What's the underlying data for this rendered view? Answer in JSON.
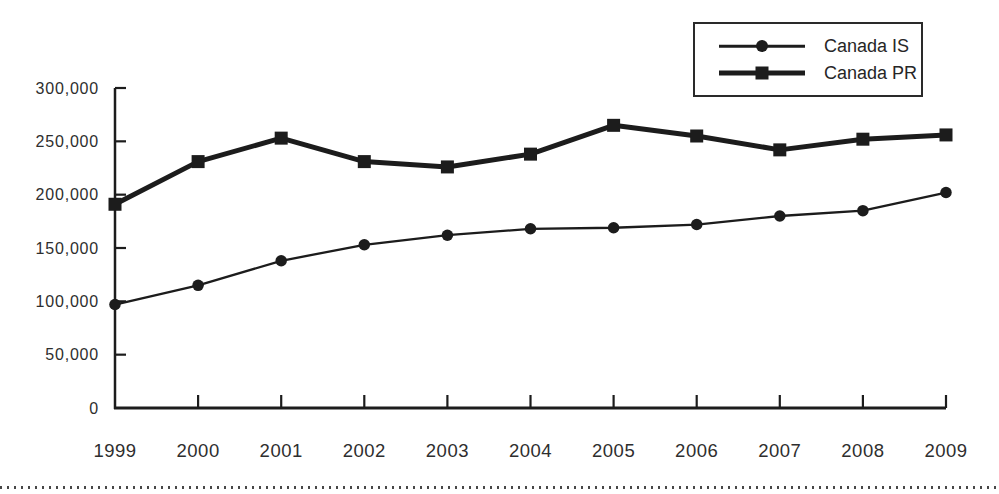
{
  "page": {
    "background": "#ffffff"
  },
  "colors": {
    "ink": "#1c1c1c",
    "text": "#2e2e2e",
    "rule_dots": "#474747"
  },
  "legend": {
    "items": [
      {
        "label": "Canada IS",
        "marker": "circle"
      },
      {
        "label": "Canada PR",
        "marker": "square"
      }
    ]
  },
  "chart_data": {
    "type": "line",
    "title": "",
    "xlabel": "",
    "ylabel": "",
    "categories": [
      "1999",
      "2000",
      "2001",
      "2002",
      "2003",
      "2004",
      "2005",
      "2006",
      "2007",
      "2008",
      "2009"
    ],
    "series": [
      {
        "name": "Canada IS",
        "marker": "circle",
        "marker_size": 11.5,
        "line_width": 2.3,
        "values": [
          97000,
          115000,
          138000,
          153000,
          162000,
          168000,
          169000,
          172000,
          180000,
          185000,
          202000
        ]
      },
      {
        "name": "Canada PR",
        "marker": "square",
        "marker_size": 13,
        "line_width": 5,
        "values": [
          191000,
          231000,
          253000,
          231000,
          226000,
          238000,
          265000,
          255000,
          242000,
          252000,
          256000
        ]
      }
    ],
    "ylim": [
      0,
      300000
    ],
    "y_ticks": [
      0,
      50000,
      100000,
      150000,
      200000,
      250000,
      300000
    ],
    "y_tick_labels": [
      "0",
      "50,000",
      "100,000",
      "150,000",
      "200,000",
      "250,000",
      "300,000"
    ],
    "grid": false,
    "legend_position": "top-right"
  }
}
